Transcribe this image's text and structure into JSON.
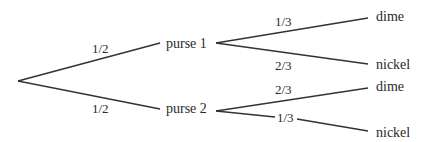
{
  "diagram": {
    "type": "probability-tree",
    "root": {
      "x": 18,
      "y": 81
    },
    "level1": [
      {
        "id": "purse1",
        "label": "purse 1",
        "edge_prob": "1/2",
        "edge_end": {
          "x": 160,
          "y": 43
        },
        "label_pos": {
          "x": 166,
          "y": 48
        },
        "prob_pos": {
          "x": 92,
          "y": 53
        },
        "junction": {
          "x": 216,
          "y": 43
        }
      },
      {
        "id": "purse2",
        "label": "purse 2",
        "edge_prob": "1/2",
        "edge_end": {
          "x": 160,
          "y": 109
        },
        "label_pos": {
          "x": 166,
          "y": 113
        },
        "prob_pos": {
          "x": 92,
          "y": 113
        },
        "junction": {
          "x": 216,
          "y": 111
        }
      }
    ],
    "level2": [
      {
        "parent": "purse1",
        "label": "dime",
        "edge_prob": "1/3",
        "edge_end": {
          "x": 368,
          "y": 18
        },
        "label_pos": {
          "x": 376,
          "y": 21
        },
        "prob_pos": {
          "x": 275,
          "y": 26
        }
      },
      {
        "parent": "purse1",
        "label": "nickel",
        "edge_prob": "2/3",
        "edge_end": {
          "x": 368,
          "y": 64
        },
        "label_pos": {
          "x": 376,
          "y": 69
        },
        "prob_pos": {
          "x": 275,
          "y": 70
        }
      },
      {
        "parent": "purse2",
        "label": "dime",
        "edge_prob": "2/3",
        "edge_end": {
          "x": 368,
          "y": 88
        },
        "label_pos": {
          "x": 376,
          "y": 91
        },
        "prob_pos": {
          "x": 275,
          "y": 94
        }
      },
      {
        "parent": "purse2",
        "label": "nickel",
        "edge_prob": "1/3",
        "edge_end": {
          "x": 368,
          "y": 131
        },
        "label_pos": {
          "x": 376,
          "y": 137
        },
        "prob_pos": {
          "x": 277,
          "y": 120
        },
        "inline_prob": true
      }
    ]
  }
}
